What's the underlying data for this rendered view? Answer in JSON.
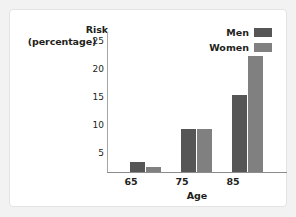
{
  "chart_data": {
    "type": "bar",
    "title": "",
    "xlabel": "Age",
    "ylabel": "Risk (percentage)",
    "ylabel_line1": "Risk",
    "ylabel_line2": "(percentage)",
    "categories": [
      "65",
      "75",
      "85"
    ],
    "series": [
      {
        "name": "Men",
        "values": [
          1.8,
          7.7,
          13.8
        ],
        "color": "#565656"
      },
      {
        "name": "Women",
        "values": [
          0.9,
          7.6,
          20.7
        ],
        "color": "#808080"
      }
    ],
    "yticks": [
      25,
      20,
      15,
      10,
      5
    ],
    "ylim": [
      0,
      25
    ],
    "grid": false,
    "legend_position": "top-right"
  },
  "legend": {
    "entries": [
      {
        "label": "Men",
        "color": "#565656"
      },
      {
        "label": "Women",
        "color": "#808080"
      }
    ]
  }
}
